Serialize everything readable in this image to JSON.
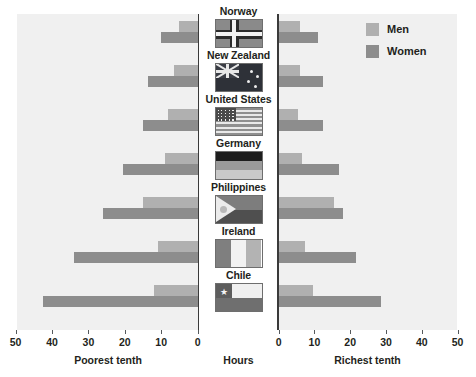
{
  "chart_data": {
    "type": "bar",
    "title": "",
    "orientation": "horizontal",
    "layout": "butterfly-diverging",
    "xlabel": "Hours",
    "ylabel": "",
    "categories": [
      "Norway",
      "New Zealand",
      "United States",
      "Germany",
      "Philippines",
      "Ireland",
      "Chile"
    ],
    "panels": [
      {
        "name": "Poorest tenth",
        "direction": "left",
        "axis_title": "Poorest tenth",
        "xlim": [
          0,
          50
        ],
        "ticks": [
          50,
          40,
          30,
          20,
          10,
          0
        ],
        "series": [
          {
            "name": "Men",
            "values": [
              5,
              6.5,
              8,
              9,
              15,
              11,
              12
            ]
          },
          {
            "name": "Women",
            "values": [
              10,
              13.5,
              15,
              20.5,
              26,
              34,
              42.5
            ]
          }
        ]
      },
      {
        "name": "Richest tenth",
        "direction": "right",
        "axis_title": "Richest tenth",
        "xlim": [
          0,
          50
        ],
        "ticks": [
          0,
          10,
          20,
          30,
          40,
          50
        ],
        "series": [
          {
            "name": "Men",
            "values": [
              6,
              6,
              5.5,
              6.5,
              15.5,
              7.5,
              9.5
            ]
          },
          {
            "name": "Women",
            "values": [
              11,
              12.5,
              12.5,
              17,
              18,
              21.5,
              28.5
            ]
          }
        ]
      }
    ],
    "legend": {
      "position": "top-right",
      "entries": [
        {
          "label": "Men",
          "color": "#b0b0b0"
        },
        {
          "label": "Women",
          "color": "#8d8d8d"
        }
      ]
    },
    "colors": {
      "men": "#b0b0b0",
      "women": "#8d8d8d",
      "panel_background": "#f0f0f0",
      "axis": "#3a3a3a"
    },
    "grid": false
  },
  "center": {
    "axis_label": "Hours",
    "rows": [
      {
        "country": "Norway",
        "flag": "norway-flag"
      },
      {
        "country": "New Zealand",
        "flag": "new-zealand-flag"
      },
      {
        "country": "United States",
        "flag": "united-states-flag"
      },
      {
        "country": "Germany",
        "flag": "germany-flag"
      },
      {
        "country": "Philippines",
        "flag": "philippines-flag"
      },
      {
        "country": "Ireland",
        "flag": "ireland-flag"
      },
      {
        "country": "Chile",
        "flag": "chile-flag"
      }
    ]
  },
  "axes": {
    "left": {
      "title": "Poorest tenth",
      "labels": [
        "50",
        "40",
        "30",
        "20",
        "10",
        "0"
      ]
    },
    "right": {
      "title": "Richest tenth",
      "labels": [
        "0",
        "10",
        "20",
        "30",
        "40",
        "50"
      ]
    }
  }
}
